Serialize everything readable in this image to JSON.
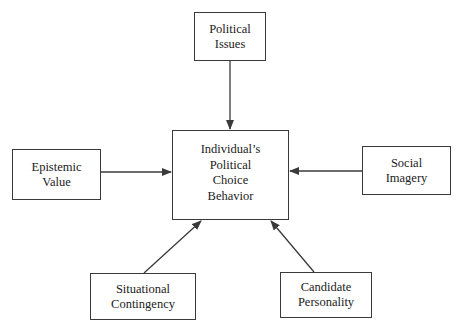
{
  "diagram": {
    "center": {
      "lines": [
        "Individual’s",
        "Political",
        "Choice",
        "Behavior"
      ]
    },
    "factors": [
      {
        "id": "political-issues",
        "lines": [
          "Political",
          "Issues"
        ],
        "position": "top"
      },
      {
        "id": "epistemic-value",
        "lines": [
          "Epistemic",
          "Value"
        ],
        "position": "left"
      },
      {
        "id": "social-imagery",
        "lines": [
          "Social",
          "Imagery"
        ],
        "position": "right"
      },
      {
        "id": "situational-contingency",
        "lines": [
          "Situational",
          "Contingency"
        ],
        "position": "bottom-left"
      },
      {
        "id": "candidate-personality",
        "lines": [
          "Candidate",
          "Personality"
        ],
        "position": "bottom-right"
      }
    ],
    "edges": [
      {
        "from": "Political Issues",
        "to": "Individual’s Political Choice Behavior"
      },
      {
        "from": "Epistemic Value",
        "to": "Individual’s Political Choice Behavior"
      },
      {
        "from": "Social Imagery",
        "to": "Individual’s Political Choice Behavior"
      },
      {
        "from": "Situational Contingency",
        "to": "Individual’s Political Choice Behavior"
      },
      {
        "from": "Candidate Personality",
        "to": "Individual’s Political Choice Behavior"
      }
    ],
    "colors": {
      "stroke": "#3a3a3a",
      "background": "#ffffff",
      "text": "#222222"
    }
  }
}
